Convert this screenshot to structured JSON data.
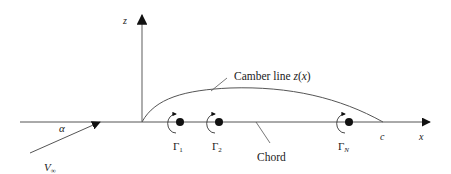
{
  "diagram": {
    "type": "thin-airfoil-vortex-distribution",
    "colors": {
      "line": "#555555",
      "ink": "#111111",
      "text": "#222222"
    },
    "axes": {
      "x_label": "x",
      "z_label": "z"
    },
    "camber": {
      "label": "Camber line z(x)",
      "label_main": "Camber line ",
      "label_func": "z",
      "label_paren_open": "(",
      "label_arg": "x",
      "label_paren_close": ")"
    },
    "chord": {
      "label": "Chord",
      "end_label": "c"
    },
    "freestream": {
      "velocity_symbol": "V",
      "velocity_subscript": "∞",
      "angle_symbol": "α"
    },
    "vortices": [
      {
        "symbol": "Γ",
        "subscript": "1"
      },
      {
        "symbol": "Γ",
        "subscript": "2"
      },
      {
        "symbol": "Γ",
        "subscript": "N"
      }
    ]
  }
}
